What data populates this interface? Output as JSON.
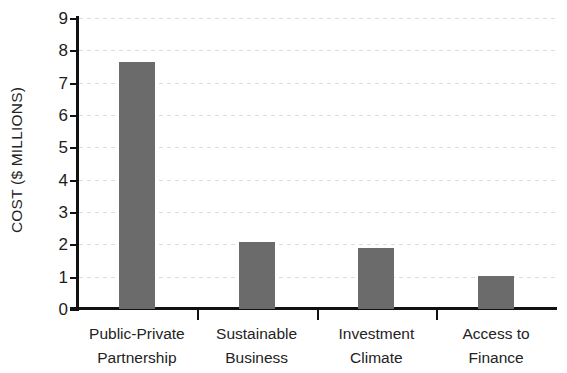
{
  "chart_data": {
    "type": "bar",
    "title": "",
    "subtitle": "",
    "xlabel": "",
    "ylabel": "COST ($ MILLIONS)",
    "categories": [
      "Public-Private Partnership",
      "Sustainable Business",
      "Investment Climate",
      "Access to Finance"
    ],
    "category_lines": [
      [
        "Public-Private",
        "Partnership"
      ],
      [
        "Sustainable",
        "Business"
      ],
      [
        "Investment",
        "Climate"
      ],
      [
        "Access to",
        "Finance"
      ]
    ],
    "values": [
      7.65,
      2.07,
      1.9,
      1.03
    ],
    "ylim": [
      0,
      9
    ],
    "ytick_labels": [
      "9",
      "8",
      "7",
      "6",
      "5",
      "4",
      "3",
      "2",
      "1",
      "0"
    ],
    "ytick_values": [
      9,
      8,
      7,
      6,
      5,
      4,
      3,
      2,
      1,
      0
    ],
    "grid": "horizontal-dashed",
    "legend": "none",
    "bar_color": "#6b6b6b",
    "axis_color": "#111111",
    "grid_color": "#dcdcdc",
    "background_color": "#ffffff"
  }
}
